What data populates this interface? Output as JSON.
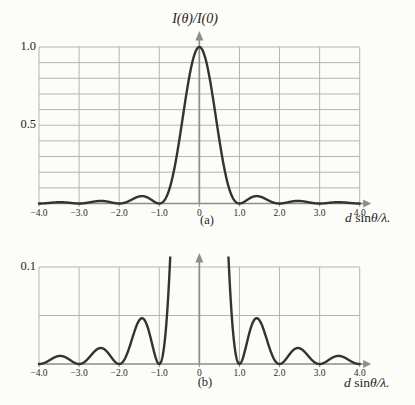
{
  "figure": {
    "background": "#fcfcf9",
    "grid_color": "#b4b4b4",
    "axis_color": "#8d8d8d",
    "curve_color": "#333333",
    "text_color": "#1f1f1f"
  },
  "chart_data": [
    {
      "id": "a",
      "type": "line",
      "title": "I(θ)/I(0)",
      "caption": "(a)",
      "xlabel": "d sinθ/λ.",
      "xlabel_parts": {
        "d": "d",
        "mid": " sin",
        "rest": "θ/λ."
      },
      "ylabel": "I(θ)/I(0)",
      "function": "sinc_squared: I(x) = (sin(πx)/(πx))^2, x = d·sinθ/λ",
      "x_range": [
        -4,
        4
      ],
      "y_range": [
        0,
        1.0
      ],
      "x_grid_step": 1.0,
      "y_grid_step": 0.1,
      "grid": true,
      "x_tick_values": [
        -4,
        -3,
        -2,
        -1,
        0,
        1,
        2,
        3,
        4
      ],
      "x_tick_labels": [
        "−4.0",
        "−3.0",
        "−2.0",
        "−1.0",
        "0",
        "1.0",
        "2.0",
        "3.0",
        "4.0"
      ],
      "y_tick_values": [
        1.0,
        0.5
      ],
      "y_tick_labels": [
        "1.0",
        "0.5"
      ],
      "key_points": {
        "central_maximum": {
          "x": 0,
          "y": 1.0
        },
        "zeros_x": [
          -4,
          -3,
          -2,
          -1,
          1,
          2,
          3,
          4
        ],
        "secondary_maxima": [
          {
            "x": -3.47,
            "y": 0.0083
          },
          {
            "x": -2.46,
            "y": 0.0165
          },
          {
            "x": -1.43,
            "y": 0.0472
          },
          {
            "x": 1.43,
            "y": 0.0472
          },
          {
            "x": 2.46,
            "y": 0.0165
          },
          {
            "x": 3.47,
            "y": 0.0083
          }
        ]
      }
    },
    {
      "id": "b",
      "type": "line",
      "title": "",
      "caption": "(b)",
      "xlabel": "d sinθ/λ.",
      "xlabel_parts": {
        "d": "d",
        "mid": " sin",
        "rest": "θ/λ."
      },
      "function": "sinc_squared: I(x) = (sin(πx)/(πx))^2, x = d·sinθ/λ (expanded vertical scale, central peak off scale)",
      "x_range": [
        -4,
        4
      ],
      "y_range": [
        0,
        0.1
      ],
      "x_grid_step": 1.0,
      "y_grid_step": 0.05,
      "grid": true,
      "x_tick_values": [
        -4,
        -3,
        -2,
        -1,
        0,
        1,
        2,
        3,
        4
      ],
      "x_tick_labels": [
        "−4.0",
        "−3.0",
        "−2.0",
        "−1.0",
        "0",
        "1.0",
        "2.0",
        "3.0",
        "4.0"
      ],
      "y_tick_values": [
        0.1
      ],
      "y_tick_labels": [
        "0.1"
      ],
      "key_points": {
        "central_maximum_off_scale": {
          "x": 0,
          "y": 1.0,
          "clipped_above": 0.1
        },
        "curve_exits_top_at_x": [
          -0.72,
          0.72
        ],
        "zeros_x": [
          -4,
          -3,
          -2,
          -1,
          1,
          2,
          3,
          4
        ],
        "secondary_maxima": [
          {
            "x": -3.47,
            "y": 0.0083
          },
          {
            "x": -2.46,
            "y": 0.0165
          },
          {
            "x": -1.43,
            "y": 0.0472
          },
          {
            "x": 1.43,
            "y": 0.0472
          },
          {
            "x": 2.46,
            "y": 0.0165
          },
          {
            "x": 3.47,
            "y": 0.0083
          }
        ]
      }
    }
  ]
}
